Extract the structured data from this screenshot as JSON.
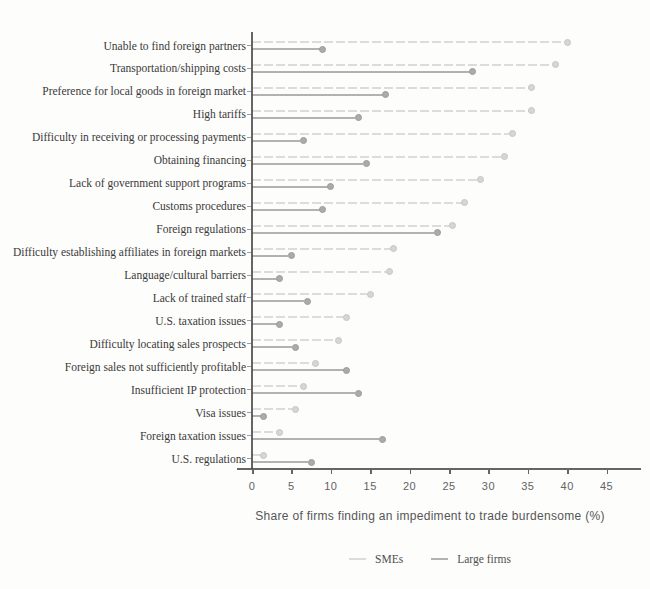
{
  "chart_data": {
    "type": "lollipop",
    "title": "",
    "xlabel": "Share of firms finding an impediment to trade burdensome (%)",
    "xlim": [
      0,
      45
    ],
    "xticks": [
      0,
      5,
      10,
      15,
      20,
      25,
      30,
      35,
      40,
      45
    ],
    "grid": false,
    "legend_position": "bottom-center",
    "categories": [
      "Unable to find foreign partners",
      "Transportation/shipping costs",
      "Preference for local goods in foreign market",
      "High tariffs",
      "Difficulty in receiving or processing payments",
      "Obtaining financing",
      "Lack of government support programs",
      "Customs procedures",
      "Foreign regulations",
      "Difficulty establishing affiliates in foreign markets",
      "Language/cultural barriers",
      "Lack of trained staff",
      "U.S. taxation issues",
      "Difficulty locating sales prospects",
      "Foreign sales not sufficiently profitable",
      "Insufficient IP protection",
      "Visa issues",
      "Foreign taxation issues",
      "U.S. regulations"
    ],
    "series": [
      {
        "name": "SMEs",
        "color": "#dcdcdc",
        "line_style": "dashed",
        "values": [
          40,
          38.5,
          35.5,
          35.5,
          33,
          32,
          29,
          27,
          25.5,
          18,
          17.5,
          15,
          12,
          11,
          8,
          6.5,
          5.5,
          3.5,
          1.5
        ]
      },
      {
        "name": "Large firms",
        "color": "#b2b2b2",
        "line_style": "solid",
        "values": [
          9,
          28,
          17,
          13.5,
          6.5,
          14.5,
          10,
          9,
          23.5,
          5,
          3.5,
          7,
          3.5,
          5.5,
          12,
          13.5,
          1.5,
          16.5,
          7.5
        ]
      }
    ],
    "axis_color": "#4a4a4a",
    "tick_label_color": "#636363",
    "category_label_color": "#3a3a3a"
  }
}
